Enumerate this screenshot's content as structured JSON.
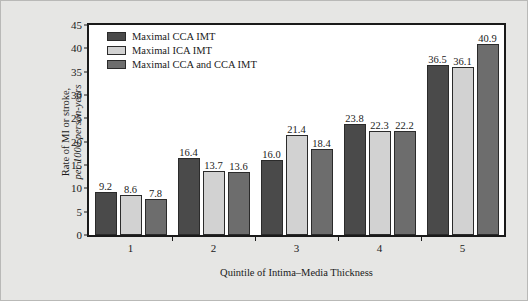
{
  "chart_data": {
    "type": "bar",
    "title": "",
    "xlabel": "Quintile of Intima–Media Thickness",
    "ylabel_line1": "Rate of MI or stroke,",
    "ylabel_line2": "per 1000 person-years",
    "categories": [
      "1",
      "2",
      "3",
      "4",
      "5"
    ],
    "ylim": [
      0,
      45
    ],
    "yticks": [
      0,
      5,
      10,
      15,
      20,
      25,
      30,
      35,
      40,
      45
    ],
    "ytick_labels": [
      "0",
      "5",
      "10",
      "15",
      "20",
      "25",
      "30",
      "35",
      "40",
      "45"
    ],
    "grid": false,
    "legend_position": "top-left-inside",
    "series": [
      {
        "name": "Maximal CCA IMT",
        "color": "#4a4a4a",
        "values": [
          9.2,
          16.4,
          16.0,
          23.8,
          36.5
        ],
        "labels": [
          "9.2",
          "16.4",
          "16.0",
          "23.8",
          "36.5"
        ]
      },
      {
        "name": "Maximal ICA IMT",
        "color": "#d2d2d2",
        "values": [
          8.6,
          13.7,
          21.4,
          22.3,
          36.1
        ],
        "labels": [
          "8.6",
          "13.7",
          "21.4",
          "22.3",
          "36.1"
        ]
      },
      {
        "name": "Maximal CCA and CCA IMT",
        "color": "#6d6d6d",
        "values": [
          7.8,
          13.6,
          18.4,
          22.2,
          40.9
        ],
        "labels": [
          "7.8",
          "13.6",
          "18.4",
          "22.2",
          "40.9"
        ]
      }
    ]
  },
  "figure": {
    "background_color": "#e6e6e4",
    "plot_background_color": "#ffffff",
    "axis_color": "#1a1a1a"
  }
}
